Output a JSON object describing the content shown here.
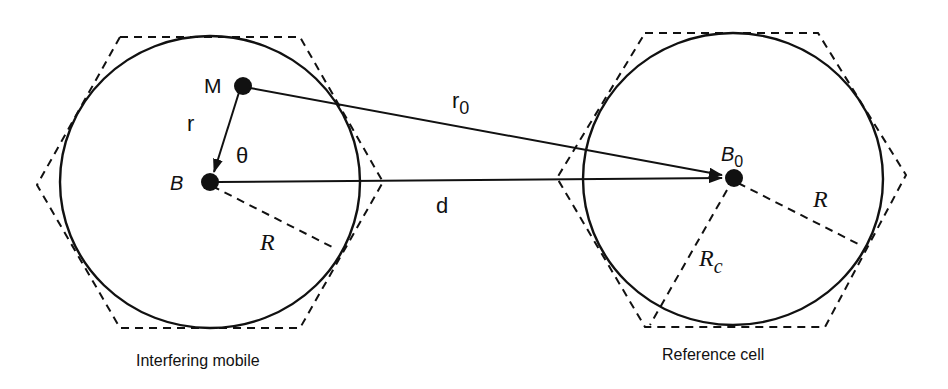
{
  "diagram": {
    "left_cell": {
      "caption": "Interfering mobile",
      "base_station_label": "B",
      "mobile_label": "M",
      "distance_label": "r",
      "angle_label": "θ",
      "radius_label": "R"
    },
    "right_cell": {
      "caption": "Reference cell",
      "base_station_label": "B",
      "base_station_subscript": "0",
      "radius_label": "R",
      "hex_radius_label": "R",
      "hex_radius_subscript": "c"
    },
    "links": {
      "mobile_to_reference_label": "r",
      "mobile_to_reference_subscript": "0",
      "base_to_base_label": "d"
    },
    "colors": {
      "stroke": "#111111",
      "background": "#ffffff"
    }
  }
}
